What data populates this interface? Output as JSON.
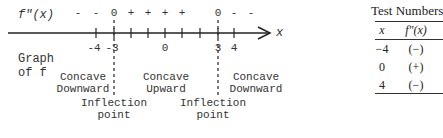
{
  "diagram": {
    "sign_label": "f\"(x)",
    "signs": [
      {
        "text": "-",
        "x": 78
      },
      {
        "text": "-",
        "x": 96
      },
      {
        "text": "0",
        "x": 114
      },
      {
        "text": "+",
        "x": 131
      },
      {
        "text": "+",
        "x": 148
      },
      {
        "text": "+",
        "x": 165
      },
      {
        "text": "+",
        "x": 182
      },
      {
        "text": "0",
        "x": 218
      },
      {
        "text": "-",
        "x": 234
      },
      {
        "text": "-",
        "x": 251
      }
    ],
    "axis_label": "x",
    "tick_labels": [
      {
        "text": "-4",
        "x": 96
      },
      {
        "text": "-3",
        "x": 114
      },
      {
        "text": "0",
        "x": 165
      },
      {
        "text": "3",
        "x": 218
      },
      {
        "text": "4",
        "x": 234
      }
    ],
    "graph_label_line1": "Graph",
    "graph_label_line2": "of f",
    "regions": [
      {
        "line1": "Concave",
        "line2": "Downward",
        "x": 66
      },
      {
        "line1": "Concave",
        "line2": "Upward",
        "x": 166
      },
      {
        "line1": "Concave",
        "line2": "Downward",
        "x": 268
      }
    ],
    "inflection_points": [
      {
        "line1": "Inflection",
        "line2": "point",
        "x": 114
      },
      {
        "line1": "Inflection",
        "line2": "point",
        "x": 212
      }
    ]
  },
  "table": {
    "title": "Test Numbers",
    "headers": [
      "x",
      "f\"(x)"
    ],
    "rows": [
      [
        "−4",
        "(−)"
      ],
      [
        "0",
        "(+)"
      ],
      [
        "4",
        "(−)"
      ]
    ]
  }
}
